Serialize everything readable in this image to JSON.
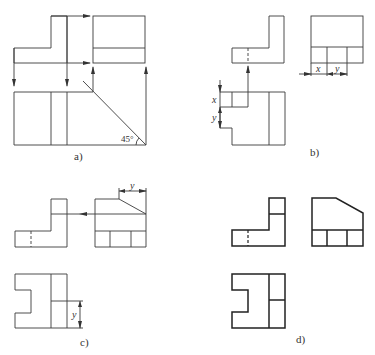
{
  "figure": {
    "panels": [
      {
        "id": "a",
        "caption": "a)",
        "angle_label": "45°"
      },
      {
        "id": "b",
        "caption": "b)",
        "dim_x": "x",
        "dim_y": "y",
        "dim_x2": "x",
        "dim_y2": "y"
      },
      {
        "id": "c",
        "caption": "c)",
        "dim_y_top": "y",
        "dim_y_side": "y"
      },
      {
        "id": "d",
        "caption": "d)"
      }
    ]
  },
  "colors": {
    "line": "#3a3a3a",
    "background": "#ffffff"
  }
}
